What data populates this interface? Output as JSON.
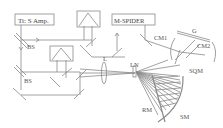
{
  "diagram": {
    "colors": {
      "line": "#888888",
      "text": "#555555",
      "background": "#ffffff"
    },
    "boxes": {
      "laser": "Ti: S Amp.",
      "spider": "M-SPIDER"
    },
    "labels": {
      "bs_top": "BS",
      "bs_bottom": "BS",
      "lens": "L",
      "cm1": "CM1",
      "grating": "G",
      "cm2": "CM2",
      "ln": "LN",
      "sqm": "SQM",
      "rm": "RM",
      "sm": "SM"
    }
  }
}
